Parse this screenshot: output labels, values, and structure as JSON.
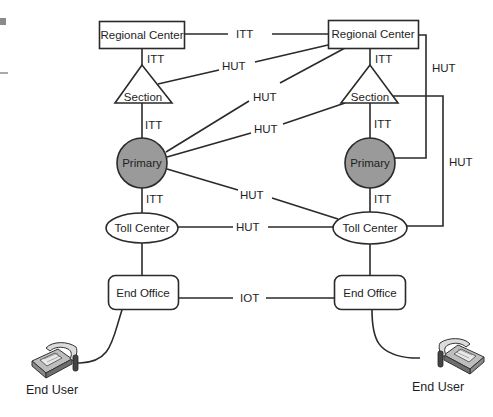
{
  "diagram": {
    "type": "telephone network hierarchy",
    "colors": {
      "line": "#2a2a2a",
      "primary_fill": "#9a9a9a",
      "node_fill": "#ffffff",
      "text": "#1e1e1e",
      "phone_body": "#bfbfbf",
      "phone_dark": "#555555"
    },
    "nodes": {
      "regional_center_left": {
        "label": "Regional Center",
        "shape": "rectangle"
      },
      "regional_center_right": {
        "label": "Regional Center",
        "shape": "rectangle"
      },
      "section_left": {
        "label": "Section",
        "shape": "triangle"
      },
      "section_right": {
        "label": "Section",
        "shape": "triangle"
      },
      "primary_left": {
        "label": "Primary",
        "shape": "circle"
      },
      "primary_right": {
        "label": "Primary",
        "shape": "circle"
      },
      "toll_center_left": {
        "label": "Toll Center",
        "shape": "ellipse"
      },
      "toll_center_right": {
        "label": "Toll Center",
        "shape": "ellipse"
      },
      "end_office_left": {
        "label": "End Office",
        "shape": "rounded-rectangle"
      },
      "end_office_right": {
        "label": "End Office",
        "shape": "rounded-rectangle"
      },
      "end_user_left": {
        "label": "End User",
        "icon": "telephone-icon"
      },
      "end_user_right": {
        "label": "End User",
        "icon": "telephone-icon"
      }
    },
    "edges": [
      {
        "from": "regional_center_left",
        "to": "regional_center_right",
        "label": "ITT"
      },
      {
        "from": "regional_center_left",
        "to": "section_left",
        "label": "ITT"
      },
      {
        "from": "section_left",
        "to": "regional_center_right",
        "label": "HUT"
      },
      {
        "from": "section_left",
        "to": "primary_left",
        "label": "ITT"
      },
      {
        "from": "primary_left",
        "to": "regional_center_right",
        "label": "HUT"
      },
      {
        "from": "primary_left",
        "to": "section_right",
        "label": "HUT"
      },
      {
        "from": "primary_left",
        "to": "toll_center_right",
        "label": "HUT"
      },
      {
        "from": "primary_left",
        "to": "toll_center_left",
        "label": "ITT"
      },
      {
        "from": "regional_center_right",
        "to": "section_right",
        "label": "ITT"
      },
      {
        "from": "regional_center_right",
        "to": "primary_right",
        "label": "HUT"
      },
      {
        "from": "section_right",
        "to": "primary_right",
        "label": "ITT"
      },
      {
        "from": "section_right",
        "to": "toll_center_right",
        "label": "HUT"
      },
      {
        "from": "primary_right",
        "to": "toll_center_right",
        "label": "ITT"
      },
      {
        "from": "toll_center_left",
        "to": "toll_center_right",
        "label": "HUT"
      },
      {
        "from": "toll_center_left",
        "to": "end_office_left",
        "label": ""
      },
      {
        "from": "toll_center_right",
        "to": "end_office_right",
        "label": ""
      },
      {
        "from": "end_office_left",
        "to": "end_office_right",
        "label": "IOT"
      },
      {
        "from": "end_office_left",
        "to": "end_user_left",
        "label": ""
      },
      {
        "from": "end_office_right",
        "to": "end_user_right",
        "label": ""
      }
    ]
  }
}
